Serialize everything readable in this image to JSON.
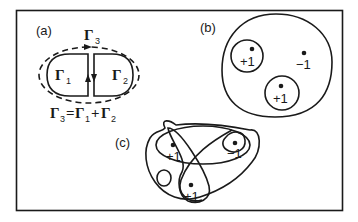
{
  "panels": {
    "a": {
      "label": "(a)",
      "contours": {
        "gamma1": {
          "symbol": "Γ",
          "sub": "1"
        },
        "gamma2": {
          "symbol": "Γ",
          "sub": "2"
        },
        "gamma3": {
          "symbol": "Γ",
          "sub": "3"
        }
      },
      "equation": {
        "lhs": "Γ",
        "lhs_sub": "3",
        "eq": "=",
        "t1": "Γ",
        "t1_sub": "1",
        "plus": "+",
        "t2": "Γ",
        "t2_sub": "2"
      }
    },
    "b": {
      "label": "(b)",
      "charges": [
        "+1",
        "−1",
        "+1"
      ]
    },
    "c": {
      "label": "(c)",
      "charges": [
        "+1",
        "−1",
        "+1"
      ]
    }
  },
  "colors": {
    "ink": "#1a1a1a",
    "background": "#ffffff"
  }
}
